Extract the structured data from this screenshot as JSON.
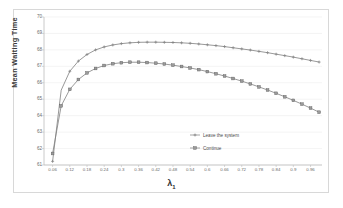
{
  "chart_data": {
    "type": "line",
    "title": "",
    "xlabel": "λ₁",
    "ylabel": "Mean Waiting Time",
    "xlim": [
      0.03,
      1.0
    ],
    "ylim": [
      61,
      70
    ],
    "grid": true,
    "legend_position": "center-right-inside",
    "y_ticks": [
      61,
      62,
      63,
      64,
      65,
      66,
      67,
      68,
      69,
      70
    ],
    "x_ticks": [
      "0.06",
      "0.12",
      "0.18",
      "0.24",
      "0.3",
      "0.36",
      "0.42",
      "0.48",
      "0.54",
      "0.6",
      "0.66",
      "0.72",
      "0.78",
      "0.84",
      "0.9",
      "0.96"
    ],
    "x": [
      0.06,
      0.09,
      0.12,
      0.15,
      0.18,
      0.21,
      0.24,
      0.27,
      0.3,
      0.33,
      0.36,
      0.39,
      0.42,
      0.45,
      0.48,
      0.51,
      0.54,
      0.57,
      0.6,
      0.63,
      0.66,
      0.69,
      0.72,
      0.75,
      0.78,
      0.81,
      0.84,
      0.87,
      0.9,
      0.93,
      0.96,
      0.99
    ],
    "series": [
      {
        "name": "Leave the system",
        "marker": "plus",
        "color": "#7f7f7f",
        "values": [
          61.22,
          65.55,
          66.7,
          67.32,
          67.72,
          68.0,
          68.18,
          68.3,
          68.38,
          68.43,
          68.46,
          68.47,
          68.47,
          68.46,
          68.45,
          68.43,
          68.4,
          68.36,
          68.31,
          68.26,
          68.2,
          68.13,
          68.06,
          67.99,
          67.91,
          67.83,
          67.74,
          67.65,
          67.56,
          67.46,
          67.36,
          67.26
        ]
      },
      {
        "name": "Continue",
        "marker": "square",
        "color": "#808080",
        "values": [
          61.7,
          64.6,
          65.6,
          66.2,
          66.6,
          66.87,
          67.05,
          67.16,
          67.22,
          67.25,
          67.25,
          67.23,
          67.19,
          67.14,
          67.07,
          66.99,
          66.9,
          66.8,
          66.68,
          66.55,
          66.41,
          66.26,
          66.1,
          65.93,
          65.75,
          65.56,
          65.36,
          65.15,
          64.93,
          64.7,
          64.46,
          64.21
        ]
      }
    ],
    "legend": [
      {
        "label": "Leave the system",
        "marker": "plus"
      },
      {
        "label": "Continue",
        "marker": "square"
      }
    ]
  }
}
